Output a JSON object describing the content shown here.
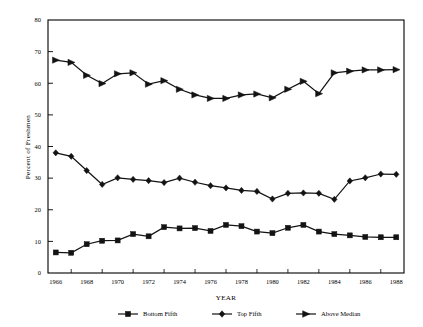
{
  "chart_data": {
    "type": "line",
    "title": "",
    "xlabel": "YEAR",
    "ylabel": "Percent of Freshmen",
    "xlim": [
      1965.5,
      1988.5
    ],
    "ylim": [
      0,
      80
    ],
    "grid": false,
    "legend_position": "bottom",
    "x": [
      1966,
      1967,
      1968,
      1969,
      1970,
      1971,
      1972,
      1973,
      1974,
      1975,
      1976,
      1977,
      1978,
      1979,
      1980,
      1981,
      1982,
      1983,
      1984,
      1985,
      1986,
      1987,
      1988
    ],
    "xticks": [
      1966,
      1968,
      1970,
      1972,
      1974,
      1976,
      1978,
      1980,
      1982,
      1984,
      1986,
      1988
    ],
    "xticklabels": [
      "1966",
      "1968",
      "1970",
      "1972",
      "1974",
      "1976",
      "1978",
      "1980",
      "1982",
      "1984",
      "1986",
      "1988"
    ],
    "yticks": [
      0,
      10,
      20,
      30,
      40,
      50,
      60,
      70,
      80
    ],
    "yticklabels": [
      "0",
      "10",
      "20",
      "30",
      "40",
      "50",
      "60",
      "70",
      "80"
    ],
    "series": [
      {
        "name": "Bottom Fifth",
        "marker": "square",
        "values": [
          6.5,
          6.4,
          9.1,
          10.2,
          10.3,
          12.3,
          11.6,
          14.5,
          14.1,
          14.2,
          13.3,
          15.2,
          14.8,
          13.1,
          12.6,
          14.3,
          15.2,
          13.1,
          12.3,
          11.9,
          11.4,
          11.3,
          11.3
        ]
      },
      {
        "name": "Top Fifth",
        "marker": "diamond",
        "values": [
          38.0,
          36.9,
          32.4,
          28.0,
          30.1,
          29.6,
          29.2,
          28.6,
          30.0,
          28.7,
          27.6,
          26.9,
          26.1,
          25.8,
          23.4,
          25.2,
          25.3,
          25.2,
          23.3,
          29.1,
          30.1,
          31.3,
          31.2
        ]
      },
      {
        "name": "Above Median",
        "marker": "triangle-right",
        "values": [
          67.3,
          66.6,
          62.5,
          59.9,
          63.0,
          63.3,
          59.7,
          60.8,
          58.1,
          56.3,
          55.2,
          55.2,
          56.3,
          56.6,
          55.4,
          58.1,
          60.6,
          56.7,
          63.3,
          63.8,
          64.2,
          64.2,
          64.3
        ]
      }
    ]
  },
  "legend": {
    "items": [
      {
        "label": "Bottom Fifth",
        "marker": "square"
      },
      {
        "label": "Top Fifth",
        "marker": "diamond"
      },
      {
        "label": "Above Median",
        "marker": "triangle-right"
      }
    ]
  }
}
